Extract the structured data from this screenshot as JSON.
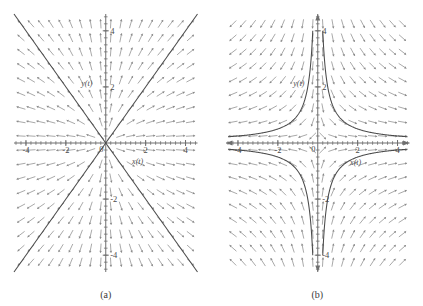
{
  "figure": {
    "width": 423,
    "height": 306,
    "background": "#ffffff",
    "panels": [
      {
        "id": "panel-a",
        "caption": "(a)",
        "axis_labels": {
          "x": "x(t)",
          "y": "y(t)"
        },
        "x_ticks": [
          "-4",
          "-2",
          "0",
          "2",
          "4"
        ],
        "y_ticks": [
          "-4",
          "-2",
          "2",
          "4"
        ],
        "origin_label": "0"
      },
      {
        "id": "panel-b",
        "caption": "(b)",
        "axis_labels": {
          "x": "x(t)",
          "y": "y(t)"
        },
        "x_ticks": [
          "-4",
          "-2",
          "0",
          "2",
          "4"
        ],
        "y_ticks": [
          "-4",
          "-2",
          "2",
          "4"
        ],
        "origin_label": "0"
      }
    ]
  },
  "colors": {
    "axis": "#6e6e6e",
    "field": "#9a9a9a",
    "trajectory": "#4a4a4a",
    "text": "#4a4a4a",
    "background": "#ffffff"
  },
  "chart_data": [
    {
      "type": "line",
      "title": "(a)",
      "subtitle": "Direction field of a proper (star) node at the origin",
      "xlabel": "x(t)",
      "ylabel": "y(t)",
      "xlim": [
        -4.6,
        4.6
      ],
      "ylim": [
        -4.6,
        4.6
      ],
      "grid": false,
      "legend": "none",
      "field": {
        "kind": "direction-field",
        "description": "Arrows point radially outward from the origin; slope at (x,y) equals y/x",
        "dx_expression": "x",
        "dy_expression": "y",
        "grid_spacing": 0.5
      },
      "series": [
        {
          "name": "separatrix-line-positive-slope",
          "equation": "y = x",
          "x": [
            -4.6,
            4.6
          ],
          "values": [
            -4.6,
            4.6
          ]
        },
        {
          "name": "separatrix-line-negative-slope",
          "equation": "y = -x",
          "x": [
            -4.6,
            4.6
          ],
          "values": [
            4.6,
            -4.6
          ]
        }
      ],
      "annotations": [
        {
          "text": "0",
          "x": -0.35,
          "y": -0.3
        },
        {
          "text": "x(t)",
          "x": 1.6,
          "y": -0.75
        },
        {
          "text": "y(t)",
          "x": -0.95,
          "y": 2.05
        }
      ]
    },
    {
      "type": "line",
      "title": "(b)",
      "subtitle": "Direction field of a saddle point at the origin",
      "xlabel": "x(t)",
      "ylabel": "y(t)",
      "xlim": [
        -4.6,
        4.6
      ],
      "ylim": [
        -4.6,
        4.6
      ],
      "grid": false,
      "legend": "none",
      "field": {
        "kind": "direction-field",
        "description": "Arrows follow a saddle; slope at (x,y) equals -y/x",
        "dx_expression": "x",
        "dy_expression": "-y",
        "grid_spacing": 0.5
      },
      "series": [
        {
          "name": "hyperbola-quadrant-I",
          "equation": "y = 1/x",
          "x": [
            0.25,
            4.5
          ],
          "values": [
            4.0,
            0.22
          ]
        },
        {
          "name": "hyperbola-quadrant-II",
          "equation": "y = -1/x",
          "x": [
            -4.5,
            -0.25
          ],
          "values": [
            0.22,
            4.0
          ]
        },
        {
          "name": "hyperbola-quadrant-III",
          "equation": "y = 1/x",
          "x": [
            -4.5,
            -0.25
          ],
          "values": [
            -0.22,
            -4.0
          ]
        },
        {
          "name": "hyperbola-quadrant-IV",
          "equation": "y = -1/x",
          "x": [
            0.25,
            4.5
          ],
          "values": [
            -4.0,
            -0.22
          ]
        }
      ],
      "annotations": [
        {
          "text": "0",
          "x": -0.35,
          "y": -0.3
        },
        {
          "text": "x(t)",
          "x": 1.9,
          "y": -0.78
        },
        {
          "text": "y(t)",
          "x": -0.95,
          "y": 2.05
        }
      ]
    }
  ]
}
